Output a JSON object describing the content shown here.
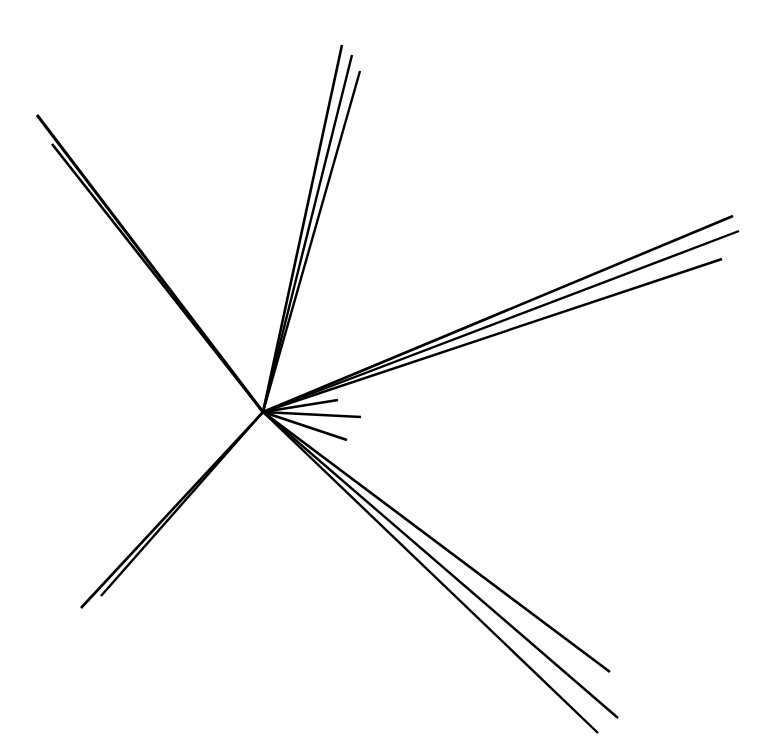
{
  "figure": {
    "background_color": "#ffffff",
    "line_color": "#000000",
    "canvas": {
      "width": 767,
      "height": 748
    }
  },
  "chart_data": {
    "type": "scatter",
    "xlabel": "",
    "ylabel": "",
    "xlim": [
      0,
      767
    ],
    "ylim": [
      0,
      748
    ],
    "grid": false,
    "legend": "none",
    "vertex": {
      "x": 263,
      "y": 412
    },
    "groups": [
      {
        "name": "upper-left-fan",
        "count": 2,
        "bearing_deg": 137,
        "tracks": [
          {
            "id": "t1",
            "x1": 263,
            "y1": 412,
            "x2": 37,
            "y2": 115,
            "width": 3.0,
            "angle_deg": 142.7,
            "length": 373
          },
          {
            "id": "t2",
            "x1": 263,
            "y1": 412,
            "x2": 52,
            "y2": 144,
            "width": 2.6,
            "angle_deg": 141.8,
            "length": 341
          }
        ]
      },
      {
        "name": "top-fan",
        "count": 3,
        "bearing_deg": 79,
        "tracks": [
          {
            "id": "t3",
            "x1": 263,
            "y1": 412,
            "x2": 342,
            "y2": 45,
            "width": 2.6,
            "angle_deg": 77.8,
            "length": 375
          },
          {
            "id": "t4",
            "x1": 263,
            "y1": 412,
            "x2": 352,
            "y2": 55,
            "width": 2.4,
            "angle_deg": 76.0,
            "length": 368
          },
          {
            "id": "t5",
            "x1": 263,
            "y1": 412,
            "x2": 360,
            "y2": 71,
            "width": 2.4,
            "angle_deg": 74.1,
            "length": 355
          }
        ]
      },
      {
        "name": "right-fan",
        "count": 3,
        "bearing_deg": 21,
        "tracks": [
          {
            "id": "t6",
            "x1": 263,
            "y1": 412,
            "x2": 733,
            "y2": 216,
            "width": 2.6,
            "angle_deg": 22.6,
            "length": 509
          },
          {
            "id": "t7",
            "x1": 263,
            "y1": 412,
            "x2": 739,
            "y2": 231,
            "width": 2.4,
            "angle_deg": 20.8,
            "length": 509
          },
          {
            "id": "t8",
            "x1": 263,
            "y1": 412,
            "x2": 722,
            "y2": 259,
            "width": 2.4,
            "angle_deg": 18.4,
            "length": 484
          }
        ]
      },
      {
        "name": "short-stub-fan",
        "count": 3,
        "bearing_deg": -5,
        "tracks": [
          {
            "id": "t9",
            "x1": 263,
            "y1": 412,
            "x2": 338,
            "y2": 400,
            "width": 2.6,
            "angle_deg": 9.1,
            "length": 76
          },
          {
            "id": "t10",
            "x1": 263,
            "y1": 412,
            "x2": 361,
            "y2": 417,
            "width": 2.6,
            "angle_deg": -2.9,
            "length": 98
          },
          {
            "id": "t11",
            "x1": 263,
            "y1": 412,
            "x2": 347,
            "y2": 440,
            "width": 2.6,
            "angle_deg": -18.4,
            "length": 89
          }
        ]
      },
      {
        "name": "lower-left-fan",
        "count": 2,
        "bearing_deg": -135,
        "tracks": [
          {
            "id": "t12",
            "x1": 263,
            "y1": 412,
            "x2": 81,
            "y2": 608,
            "width": 2.6,
            "angle_deg": -132.9,
            "length": 267
          },
          {
            "id": "t13",
            "x1": 263,
            "y1": 412,
            "x2": 101,
            "y2": 596,
            "width": 2.4,
            "angle_deg": -131.4,
            "length": 245
          }
        ]
      },
      {
        "name": "lower-right-fan",
        "count": 3,
        "bearing_deg": -48,
        "tracks": [
          {
            "id": "t14",
            "x1": 263,
            "y1": 412,
            "x2": 610,
            "y2": 672,
            "width": 2.6,
            "angle_deg": -36.8,
            "length": 434
          },
          {
            "id": "t15",
            "x1": 263,
            "y1": 412,
            "x2": 618,
            "y2": 718,
            "width": 2.4,
            "angle_deg": -40.7,
            "length": 469
          },
          {
            "id": "t16",
            "x1": 263,
            "y1": 412,
            "x2": 598,
            "y2": 733,
            "width": 2.4,
            "angle_deg": -43.8,
            "length": 464
          }
        ]
      }
    ],
    "total_tracks": 16
  }
}
